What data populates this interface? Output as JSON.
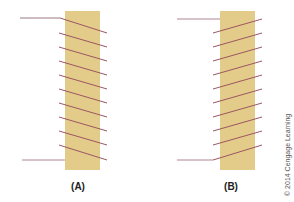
{
  "figure": {
    "panels": [
      {
        "id": "A",
        "label": "(A)",
        "winding": "descending-left-to-right",
        "turns": 10
      },
      {
        "id": "B",
        "label": "(B)",
        "winding": "ascending-left-to-right",
        "turns": 10
      }
    ],
    "copyright": "© 2014 Cengage Learning",
    "colors": {
      "core": "#e3cc8a",
      "wire": "#a0606a",
      "lead": "#b08890"
    }
  }
}
